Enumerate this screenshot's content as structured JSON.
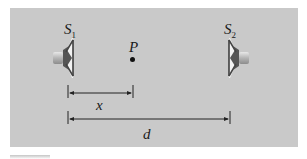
{
  "diagram": {
    "background_color": "#c9c9c9",
    "sources": [
      {
        "id": "S1",
        "label": "S",
        "subscript": "1",
        "orientation": "facing-right"
      },
      {
        "id": "S2",
        "label": "S",
        "subscript": "2",
        "orientation": "facing-left"
      }
    ],
    "point": {
      "label": "P"
    },
    "dimensions": [
      {
        "label": "x",
        "from": "S1",
        "to": "P"
      },
      {
        "label": "d",
        "from": "S1",
        "to": "S2"
      }
    ]
  }
}
